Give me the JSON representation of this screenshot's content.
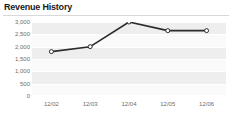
{
  "widget": {
    "title": "Revenue History",
    "width": 232,
    "height": 115,
    "background": "#ffffff",
    "title_color": "#1a1a1a",
    "rule_color": "#d8d8d8"
  },
  "chart_data": {
    "type": "line",
    "title": "Revenue History",
    "xlabel": "",
    "ylabel": "",
    "categories": [
      "12/02",
      "12/03",
      "12/04",
      "12/05",
      "12/06"
    ],
    "values": [
      1800,
      2000,
      3000,
      2650,
      2650
    ],
    "series": [
      {
        "name": "Revenue",
        "values": [
          1800,
          2000,
          3000,
          2650,
          2650
        ]
      }
    ],
    "ylim": [
      0,
      3000
    ],
    "ytick_values": [
      3000,
      2500,
      2000,
      1500,
      1000,
      500,
      0
    ],
    "ytick_labels": [
      "3,000",
      "2,500",
      "2,000",
      "1,500",
      "1,000",
      "500",
      "0"
    ],
    "xtick_labels": [
      "12/02",
      "12/03",
      "12/04",
      "12/05",
      "12/06"
    ],
    "grid": true,
    "grid_orientation": "horizontal",
    "grid_color": "#ffffff",
    "band_color": "#eeeeee",
    "plot_background": "#fafafa",
    "legend": false,
    "legend_position": "none",
    "line_color": "#2b2b2b",
    "line_width": 1.6,
    "marker": "open-circle",
    "marker_face_color": "#ffffff",
    "marker_edge_color": "#2b2b2b",
    "marker_size": 3,
    "tick_label_color": "#6e6e6e"
  }
}
